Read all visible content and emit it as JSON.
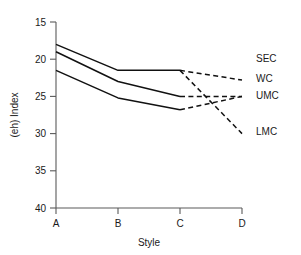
{
  "chart_data": {
    "type": "line",
    "title": "",
    "xlabel": "Style",
    "ylabel": "(eh) Index",
    "categories": [
      "A",
      "B",
      "C",
      "D"
    ],
    "x_tick_labels": [
      "A",
      "B",
      "C",
      "D"
    ],
    "y_tick_labels": [
      "15",
      "20",
      "25",
      "30",
      "35",
      "40"
    ],
    "y_ticks": [
      15,
      20,
      25,
      30,
      35,
      40
    ],
    "ylim": [
      15,
      40
    ],
    "y_axis_inverted": true,
    "grid": false,
    "legend_position": "right-inline",
    "series": [
      {
        "name": "SEC",
        "label": "SEC",
        "values": [
          18.0,
          21.5,
          21.5,
          22.8
        ],
        "solid_through": 3,
        "style": "solid-then-dashed"
      },
      {
        "name": "WC",
        "label": "WC",
        "values": [
          19.0,
          23.0,
          25.0,
          25.0
        ],
        "solid_through": 3,
        "style": "solid-then-dashed"
      },
      {
        "name": "UMC",
        "label": "UMC",
        "values": [
          21.5,
          25.2,
          26.8,
          25.0
        ],
        "solid_through": 3,
        "style": "solid-then-dashed"
      },
      {
        "name": "LMC",
        "label": "LMC",
        "values": [
          18.0,
          21.5,
          21.5,
          30.0
        ],
        "solid_through": 3,
        "style": "dashed-tail-only"
      }
    ]
  },
  "axis": {
    "y_label": "(eh) Index",
    "x_label": "Style",
    "y_tick_15": "15",
    "y_tick_20": "20",
    "y_tick_25": "25",
    "y_tick_30": "30",
    "y_tick_35": "35",
    "y_tick_40": "40",
    "x_tick_a": "A",
    "x_tick_b": "B",
    "x_tick_c": "C",
    "x_tick_d": "D"
  },
  "legend": {
    "sec": "SEC",
    "wc": "WC",
    "umc": "UMC",
    "lmc": "LMC"
  },
  "colors": {
    "line": "#111111",
    "axis": "#5a5a5a",
    "text": "#1a1a1a",
    "background": "#ffffff"
  }
}
